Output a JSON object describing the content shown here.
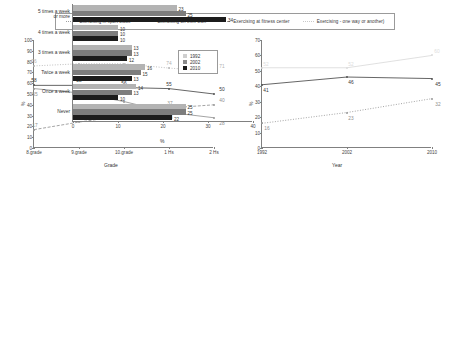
{
  "top_legend": {
    "items": [
      {
        "label": "Exercising in sport clubs",
        "style": "sport",
        "color": "#9f9f9f"
      },
      {
        "label": "Exercising on their own",
        "style": "own",
        "color": "#555555"
      },
      {
        "label": "Exercising at fitness center",
        "style": "fit",
        "color": "#9a9a9a"
      },
      {
        "label": "Exercising - one way or another)",
        "style": "any",
        "color": "#c9c9c9"
      }
    ]
  },
  "chart_data": [
    {
      "id": "grade-chart",
      "type": "line",
      "title": "",
      "xlabel": "Grade",
      "ylabel": "%",
      "categories": [
        "8.grade",
        "9.grade",
        "10.grade",
        "1 Hs",
        "2 Hs"
      ],
      "ylim": [
        0,
        100
      ],
      "yticks": [
        0,
        10,
        20,
        30,
        40,
        50,
        60,
        70,
        80,
        90,
        100
      ],
      "grid": false,
      "legend": "top",
      "series": [
        {
          "name": "Exercising - one way or another)",
          "values": [
            76,
            78,
            78,
            74,
            71
          ],
          "color": "#b9b9b9",
          "dash": "dotted"
        },
        {
          "name": "Exercising in sport clubs",
          "values": [
            58,
            58,
            56,
            55,
            50
          ],
          "color": "#555555",
          "dash": "solid"
        },
        {
          "name": "Exercising on their own",
          "values": [
            55,
            51,
            43,
            33,
            28
          ],
          "color": "#9a9a9a",
          "dash": "solid"
        },
        {
          "name": "Exercising at fitness center",
          "values": [
            17,
            24,
            30,
            37,
            40
          ],
          "color": "#9a9a9a",
          "dash": "dashed"
        }
      ]
    },
    {
      "id": "year-chart",
      "type": "line",
      "title": "",
      "xlabel": "Year",
      "ylabel": "%",
      "categories": [
        "1992",
        "2002",
        "2010"
      ],
      "ylim": [
        0,
        70
      ],
      "yticks": [
        0,
        10,
        20,
        30,
        40,
        50,
        60,
        70
      ],
      "grid": false,
      "series": [
        {
          "name": "Exercising - one way or another)",
          "values": [
            52,
            52,
            60
          ],
          "color": "#dcdcdc",
          "dash": "solid"
        },
        {
          "name": "Exercising in sport clubs",
          "values": [
            41,
            46,
            45
          ],
          "color": "#555555",
          "dash": "solid"
        },
        {
          "name": "Exercising at fitness center",
          "values": [
            16,
            23,
            32
          ],
          "color": "#9a9a9a",
          "dash": "dotted"
        }
      ]
    },
    {
      "id": "frequency-chart",
      "type": "bar",
      "orientation": "horizontal",
      "xlabel": "%",
      "ylabel": "",
      "xlim": [
        0,
        40
      ],
      "xticks": [
        0,
        10,
        20,
        30,
        40
      ],
      "categories": [
        "5 times a week\nor more",
        "4 times a week",
        "3 times a week",
        "Twice a week",
        "Once a week",
        "Never"
      ],
      "series": [
        {
          "name": "1992",
          "color": "#b3b3b3",
          "values": [
            23,
            10,
            13,
            16,
            14,
            25
          ]
        },
        {
          "name": "2002",
          "color": "#7d7d7d",
          "values": [
            25,
            10,
            13,
            15,
            13,
            25
          ]
        },
        {
          "name": "2010",
          "color": "#1c1c1c",
          "values": [
            34,
            10,
            12,
            13,
            10,
            22
          ]
        }
      ],
      "legend": [
        "1992",
        "2002",
        "2010"
      ]
    }
  ]
}
